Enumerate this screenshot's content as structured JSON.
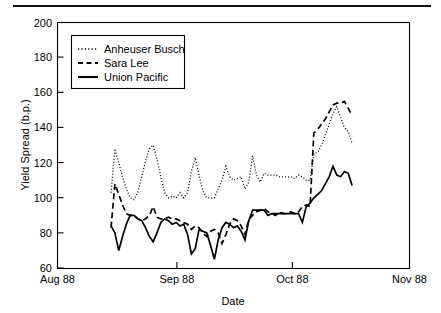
{
  "figure": {
    "name": "yield-spread-time-series",
    "background": "#ffffff",
    "ink": "#000000",
    "top_rule": true
  },
  "axis": {
    "ylabel": "Yield Spread (b.p.)",
    "xlabel": "Date",
    "yticks": [
      "60",
      "80",
      "100",
      "120",
      "140",
      "160",
      "180",
      "200"
    ],
    "xticks": [
      "Aug 88",
      "Sep 88",
      "Oct 88",
      "Nov 88"
    ]
  },
  "legend": {
    "items": [
      {
        "label": "Anheuser Busch",
        "style": "dotted"
      },
      {
        "label": "Sara Lee",
        "style": "dashed"
      },
      {
        "label": "Union Pacific",
        "style": "solid"
      }
    ]
  },
  "chart_data": {
    "type": "line",
    "title": "",
    "xlabel": "Date",
    "ylabel": "Yield Spread (b.p.)",
    "xlim": [
      0,
      92
    ],
    "ylim": [
      60,
      200
    ],
    "xtick_values": [
      0,
      31,
      61,
      92
    ],
    "xtick_labels": [
      "Aug 88",
      "Sep 88",
      "Oct 88",
      "Nov 88"
    ],
    "ytick_values": [
      60,
      80,
      100,
      120,
      140,
      160,
      180,
      200
    ],
    "grid": false,
    "legend_position": "upper-left-inside",
    "x": [
      14,
      15,
      16,
      17,
      18,
      19,
      20,
      21,
      22,
      23,
      24,
      25,
      26,
      27,
      28,
      29,
      30,
      31,
      32,
      33,
      34,
      35,
      36,
      37,
      38,
      39,
      40,
      41,
      42,
      43,
      44,
      45,
      46,
      47,
      48,
      49,
      50,
      51,
      52,
      53,
      54,
      55,
      56,
      57,
      58,
      59,
      60,
      61,
      62,
      63,
      64,
      65,
      66,
      67,
      68,
      69,
      70,
      71,
      72,
      73,
      74,
      75,
      76,
      77
    ],
    "series": [
      {
        "name": "Anheuser Busch",
        "style": "dotted",
        "values": [
          103,
          128,
          120,
          112,
          105,
          100,
          99,
          103,
          112,
          121,
          128,
          130,
          122,
          112,
          103,
          100,
          101,
          100,
          103,
          100,
          103,
          115,
          123,
          113,
          104,
          100,
          100,
          100,
          105,
          110,
          118,
          112,
          110,
          111,
          112,
          105,
          109,
          124,
          113,
          109,
          114,
          113,
          113,
          113,
          112,
          112,
          112,
          112,
          111,
          113,
          112,
          110,
          110,
          125,
          126,
          130,
          136,
          142,
          148,
          152,
          146,
          140,
          138,
          131
        ]
      },
      {
        "name": "Sara Lee",
        "style": "dashed",
        "values": [
          83,
          108,
          102,
          96,
          91,
          90,
          90,
          88,
          87,
          88,
          90,
          95,
          89,
          88,
          88,
          89,
          88,
          88,
          87,
          86,
          85,
          82,
          84,
          83,
          80,
          78,
          81,
          82,
          80,
          74,
          79,
          85,
          88,
          87,
          84,
          79,
          88,
          90,
          92,
          93,
          94,
          92,
          91,
          90,
          92,
          91,
          91,
          92,
          91,
          92,
          95,
          96,
          95,
          137,
          139,
          142,
          145,
          149,
          153,
          154,
          154,
          155,
          151,
          147
        ]
      },
      {
        "name": "Union Pacific",
        "style": "solid",
        "values": [
          84,
          80,
          70,
          78,
          85,
          90,
          90,
          88,
          87,
          83,
          78,
          75,
          80,
          86,
          88,
          87,
          85,
          86,
          84,
          85,
          79,
          68,
          71,
          82,
          81,
          80,
          73,
          65,
          76,
          83,
          86,
          85,
          83,
          84,
          81,
          76,
          87,
          93,
          93,
          93,
          93,
          90,
          91,
          91,
          91,
          91,
          91,
          91,
          91,
          91,
          86,
          95,
          97,
          100,
          102,
          104,
          108,
          112,
          118,
          113,
          112,
          115,
          114,
          107
        ]
      }
    ]
  }
}
